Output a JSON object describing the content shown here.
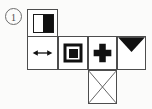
{
  "figure": {
    "item_number": "1",
    "colors": {
      "ink": "#111111",
      "grid_line": "#4d4d4d",
      "number_outline": "#6d6d6d",
      "paper": "#fbfbfa",
      "cell_fill": "#ffffff"
    },
    "cells": [
      {
        "id": "cell-half",
        "name": "half-filled-rectangle-cell",
        "symbol": "half-filled-rectangle-icon",
        "row": 1,
        "col": 1
      },
      {
        "id": "cell-arrow",
        "name": "double-arrow-cell",
        "symbol": "double-headed-arrow-icon",
        "row": 2,
        "col": 1
      },
      {
        "id": "cell-square",
        "name": "concentric-squares-cell",
        "symbol": "concentric-squares-icon",
        "row": 2,
        "col": 2
      },
      {
        "id": "cell-plus",
        "name": "plus-cross-cell",
        "symbol": "plus-cross-icon",
        "row": 2,
        "col": 3
      },
      {
        "id": "cell-triangle",
        "name": "down-triangle-cell",
        "symbol": "filled-down-triangle-icon",
        "row": 2,
        "col": 4
      },
      {
        "id": "cell-diagonals",
        "name": "crossed-diagonals-cell",
        "symbol": "crossed-diagonals-icon",
        "row": 3,
        "col": 3
      }
    ]
  }
}
